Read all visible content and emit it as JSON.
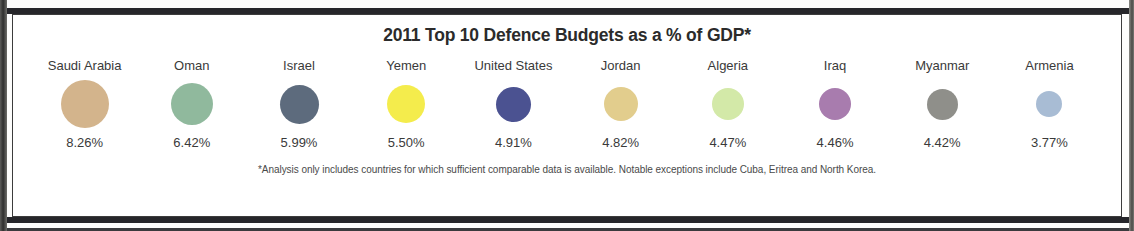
{
  "title": "2011 Top 10 Defence Budgets as a % of GDP*",
  "footnote": "*Analysis only includes countries for which sufficient comparable data is available. Notable exceptions include Cuba, Eritrea and North Korea.",
  "chart_data": {
    "type": "bubble",
    "title": "2011 Top 10 Defence Budgets as a % of GDP*",
    "xlabel": "",
    "ylabel": "Defence budget as a % of GDP",
    "categories": [
      "Saudi Arabia",
      "Oman",
      "Israel",
      "Yemen",
      "United States",
      "Jordan",
      "Algeria",
      "Iraq",
      "Myanmar",
      "Armenia"
    ],
    "values": [
      8.26,
      6.42,
      5.99,
      5.5,
      4.91,
      4.82,
      4.47,
      4.46,
      4.42,
      3.77
    ],
    "value_labels": [
      "8.26%",
      "6.42%",
      "5.99%",
      "5.50%",
      "4.91%",
      "4.82%",
      "4.47%",
      "4.46%",
      "4.42%",
      "3.77%"
    ],
    "colors": [
      "#d3b48c",
      "#90b99d",
      "#5d6b7d",
      "#f4ec4c",
      "#4b5291",
      "#e2cd8d",
      "#d3e9a8",
      "#a87cae",
      "#8f8f8a",
      "#a8bcd4"
    ],
    "bubble_diameters_px": [
      48,
      42,
      39,
      38,
      35,
      34,
      32,
      32,
      31,
      26
    ],
    "legend": "none",
    "grid": false
  },
  "items": [
    {
      "country": "Saudi Arabia",
      "value": "8.26%",
      "color": "#d3b48c",
      "size": 48
    },
    {
      "country": "Oman",
      "value": "6.42%",
      "color": "#90b99d",
      "size": 42
    },
    {
      "country": "Israel",
      "value": "5.99%",
      "color": "#5d6b7d",
      "size": 39
    },
    {
      "country": "Yemen",
      "value": "5.50%",
      "color": "#f4ec4c",
      "size": 38
    },
    {
      "country": "United States",
      "value": "4.91%",
      "color": "#4b5291",
      "size": 35
    },
    {
      "country": "Jordan",
      "value": "4.82%",
      "color": "#e2cd8d",
      "size": 34
    },
    {
      "country": "Algeria",
      "value": "4.47%",
      "color": "#d3e9a8",
      "size": 32
    },
    {
      "country": "Iraq",
      "value": "4.46%",
      "color": "#a87cae",
      "size": 32
    },
    {
      "country": "Myanmar",
      "value": "4.42%",
      "color": "#8f8f8a",
      "size": 31
    },
    {
      "country": "Armenia",
      "value": "3.77%",
      "color": "#a8bcd4",
      "size": 26
    }
  ]
}
